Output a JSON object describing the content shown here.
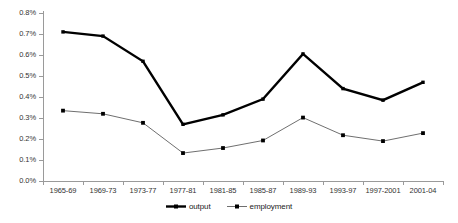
{
  "chart_data": {
    "type": "line",
    "title": "",
    "xlabel": "",
    "ylabel": "",
    "ylim": [
      0,
      0.8
    ],
    "grid": false,
    "legend_position": "bottom",
    "y_tick_labels": [
      "0.8%",
      "0.7%",
      "0.6%",
      "0.5%",
      "0.4%",
      "0.3%",
      "0.2%",
      "0.1%",
      "0.0%"
    ],
    "y_tick_values": [
      0.8,
      0.7,
      0.6,
      0.5,
      0.4,
      0.3,
      0.2,
      0.1,
      0.0
    ],
    "categories": [
      "1965-69",
      "1969-73",
      "1973-77",
      "1977-81",
      "1981-85",
      "1985-87",
      "1989-93",
      "1993-97",
      "1997-2001",
      "2001-04"
    ],
    "series": [
      {
        "name": "output",
        "color": "#000000",
        "marker": "square",
        "line_width": 2.4,
        "values": [
          0.71,
          0.69,
          0.57,
          0.27,
          0.315,
          0.39,
          0.605,
          0.44,
          0.385,
          0.47
        ]
      },
      {
        "name": "employment",
        "color": "#6f6f6f",
        "marker": "square",
        "line_width": 1.0,
        "values": [
          0.335,
          0.32,
          0.277,
          0.133,
          0.157,
          0.193,
          0.302,
          0.218,
          0.19,
          0.228
        ]
      }
    ]
  },
  "legend": {
    "entries": [
      {
        "label": "output"
      },
      {
        "label": "employment"
      }
    ]
  }
}
